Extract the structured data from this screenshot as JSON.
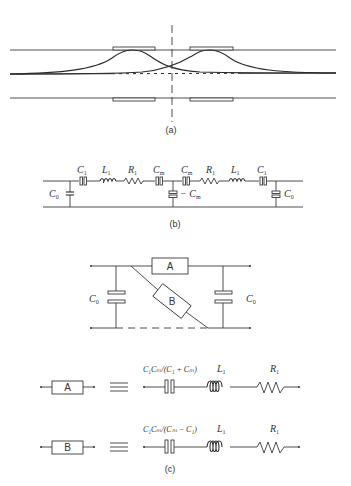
{
  "figure": {
    "panels": [
      {
        "id": "a",
        "caption": "(a)",
        "description": "Two-resonator monolithic crystal filter cross-section with electrode pairs and overlapping energy-trapping mode profiles"
      },
      {
        "id": "b",
        "caption": "(b)",
        "labels": {
          "c0_left": "C",
          "c0_left_sub": "0",
          "c1_left": "C",
          "c1_left_sub": "1",
          "l1_left": "L",
          "l1_left_sub": "1",
          "r1_left": "R",
          "r1_left_sub": "1",
          "cm_left": "C",
          "cm_left_sub": "m",
          "cm_right": "C",
          "cm_right_sub": "m",
          "neg_cm": "− C",
          "neg_cm_sub": "m",
          "r1_right": "R",
          "r1_right_sub": "1",
          "l1_right": "L",
          "l1_right_sub": "1",
          "c1_right": "C",
          "c1_right_sub": "1",
          "c0_right": "C",
          "c0_right_sub": "0"
        }
      },
      {
        "id": "c",
        "caption": "(c)",
        "network": {
          "box_a": "A",
          "box_b": "B",
          "c0_left": "C",
          "c0_left_sub": "0",
          "c0_right": "C",
          "c0_right_sub": "0"
        },
        "equivalents": [
          {
            "box": "A",
            "equiv_symbol": "≡",
            "cap_label": "C₁Cₘ/(C₁ + Cₘ)",
            "ind_label": "L",
            "ind_sub": "1",
            "res_label": "R",
            "res_sub": "1"
          },
          {
            "box": "B",
            "equiv_symbol": "≡",
            "cap_label": "C₁Cₘ/(Cₘ − C₁)",
            "ind_label": "L",
            "ind_sub": "1",
            "res_label": "R",
            "res_sub": "1"
          }
        ]
      }
    ]
  }
}
